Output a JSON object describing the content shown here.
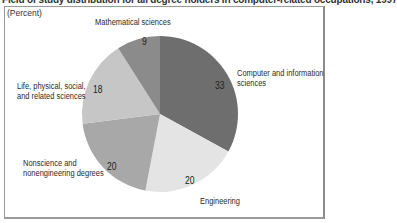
{
  "title": "Field of study distribution for all degree holders in computer-related occupations, 1997",
  "unit_label": "(Percent)",
  "colors": {
    "computer": "#6e6e6e",
    "engineering": "#e4e4e4",
    "nonscience": "#a8a8a8",
    "life": "#c6c6c6",
    "math": "#8b8b8b"
  },
  "labels": {
    "math": "Mathematical sciences",
    "life_1": "Life, physical, social,",
    "life_2": "and related sciences",
    "nonsci_1": "Nonscience and",
    "nonsci_2": "nonengineering degrees",
    "comp_1": "Computer and information",
    "comp_2": "sciences",
    "eng": "Engineering"
  },
  "values": {
    "computer": "33",
    "engineering": "20",
    "nonscience": "20",
    "life": "18",
    "math": "9"
  },
  "chart_data": {
    "type": "pie",
    "title": "Field of study distribution for all degree holders in computer-related occupations, 1997",
    "unit": "Percent",
    "start_angle": "12 o'clock, clockwise",
    "categories": [
      "Computer and information sciences",
      "Engineering",
      "Nonscience and nonengineering degrees",
      "Life, physical, social, and related sciences",
      "Mathematical sciences"
    ],
    "values": [
      33,
      20,
      20,
      18,
      9
    ]
  }
}
